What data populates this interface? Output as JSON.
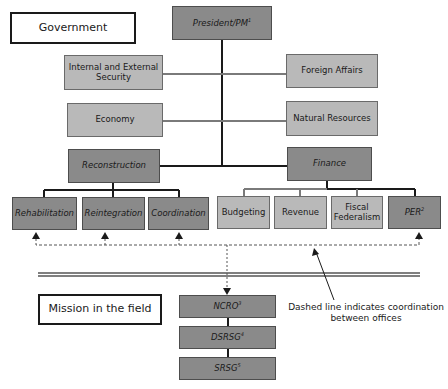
{
  "sections": {
    "government_label": "Government",
    "mission_label": "Mission in the field"
  },
  "government": {
    "head": {
      "label": "President/PM",
      "footnote": "1"
    },
    "ministries_left": [
      "Internal and External Security",
      "Economy"
    ],
    "ministries_right": [
      "Foreign Affairs",
      "Natural Resources"
    ],
    "reconstruction": {
      "label": "Reconstruction",
      "children": [
        "Rehabilitation",
        "Reintegration",
        "Coordination"
      ]
    },
    "finance": {
      "label": "Finance",
      "children": [
        {
          "label": "Budgeting",
          "footnote": ""
        },
        {
          "label": "Revenue",
          "footnote": ""
        },
        {
          "label": "Fiscal Federalism",
          "footnote": ""
        },
        {
          "label": "PER",
          "footnote": "2"
        }
      ]
    }
  },
  "mission": {
    "offices": [
      {
        "label": "NCRO",
        "footnote": "3"
      },
      {
        "label": "DSRSG",
        "footnote": "4"
      },
      {
        "label": "SRSG",
        "footnote": "5"
      }
    ]
  },
  "annotation": {
    "line1": "Dashed line indicates coordination",
    "line2": "between offices"
  },
  "colors": {
    "dark_box": "#8a8a8a",
    "light_box": "#b9b9b9",
    "line_dark": "#1a1a1a",
    "line_gray": "#7a7a7a"
  }
}
